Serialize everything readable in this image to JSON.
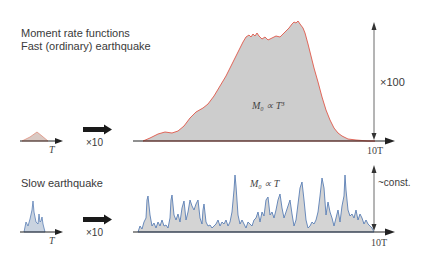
{
  "title": {
    "line1": "Moment rate functions",
    "line2": "Fast (ordinary) earthquake"
  },
  "fast": {
    "small_axis_label": "T",
    "scale_arrow_label": "×10",
    "large_axis_label": "10T",
    "amplitude_label": "×100",
    "scaling_law": "M₀ ∝ T³",
    "fill_color": "#cfcfcf",
    "line_color": "#e0584a"
  },
  "slow": {
    "title": "Slow earthquake",
    "small_axis_label": "T",
    "scale_arrow_label": "×10",
    "large_axis_label": "10T",
    "amplitude_label": "~const.",
    "scaling_law": "M₀ ∝ T",
    "fill_color": "#d4d4d4",
    "line_color": "#5a7fb5"
  }
}
